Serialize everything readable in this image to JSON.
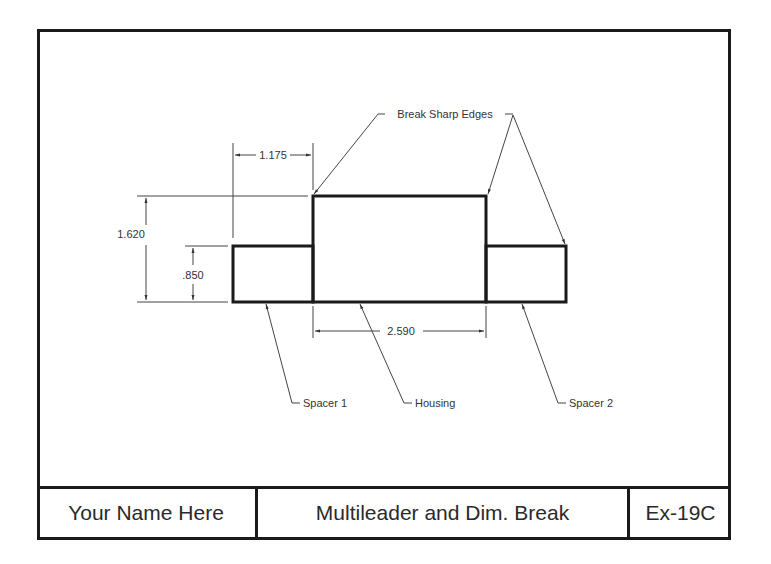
{
  "drawing": {
    "parts": [
      {
        "name": "Spacer 1",
        "x": 233,
        "y": 246,
        "w": 80,
        "h": 56
      },
      {
        "name": "Housing",
        "x": 313,
        "y": 196,
        "w": 173,
        "h": 106
      },
      {
        "name": "Spacer 2",
        "x": 486,
        "y": 246,
        "w": 80,
        "h": 56
      }
    ],
    "dimensions": {
      "top_width": "1.175",
      "overall_height": "1.620",
      "spacer_height": ".850",
      "housing_width": "2.590"
    },
    "leaders": {
      "break_edges": "Break Sharp Edges",
      "spacer1": "Spacer 1",
      "housing": "Housing",
      "spacer2": "Spacer 2"
    },
    "colors": {
      "line": "#1a1a1a",
      "thin": "#444444",
      "text": "#333333"
    }
  },
  "title_block": {
    "name": "Your Name Here",
    "title": "Multileader and Dim. Break",
    "number": "Ex-19C"
  }
}
